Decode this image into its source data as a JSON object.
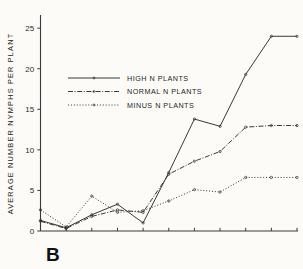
{
  "figure": {
    "panel_label": "B",
    "background_color": "#fdfdfb",
    "ink_color": "#2e2e2e"
  },
  "chart_data": {
    "type": "line",
    "title": "",
    "subtitle": "",
    "panel": "B",
    "xlabel": "",
    "ylabel": "AVERAGE  NUMBER  NYMPHS  PER  PLANT",
    "xlim": [
      0,
      10
    ],
    "ylim": [
      0,
      26.5
    ],
    "yticks": [
      0,
      5,
      10,
      15,
      20,
      25
    ],
    "ytick_labels": [
      "0",
      "5",
      "10",
      "15",
      "20",
      "25"
    ],
    "xticks": [
      0,
      1,
      2,
      3,
      4,
      5,
      6,
      7,
      8,
      9,
      10
    ],
    "xtick_labels": [
      "",
      "",
      "",
      "",
      "",
      "",
      "",
      "",
      "",
      "",
      ""
    ],
    "grid": false,
    "legend_position": "upper-left-inside",
    "x": [
      0,
      1,
      2,
      3,
      4,
      5,
      6,
      7,
      8,
      9,
      10
    ],
    "series": [
      {
        "name": "HIGH  N  PLANTS",
        "linestyle": "solid",
        "color": "#2e2e2e",
        "values": [
          1.3,
          0.4,
          2.0,
          3.3,
          1.0,
          7.2,
          13.8,
          12.9,
          19.3,
          24.0,
          24.0
        ]
      },
      {
        "name": "NORMAL  N  PLANTS",
        "linestyle": "dash-dot",
        "color": "#2e2e2e",
        "values": [
          1.2,
          0.3,
          1.8,
          2.6,
          2.3,
          7.0,
          8.6,
          9.8,
          12.8,
          13.0,
          13.0
        ]
      },
      {
        "name": "MINUS  N  PLANTS",
        "linestyle": "dotted",
        "color": "#2e2e2e",
        "values": [
          2.6,
          0.5,
          4.3,
          2.3,
          2.5,
          3.7,
          5.1,
          4.8,
          6.6,
          6.6,
          6.6
        ]
      }
    ]
  },
  "legend": {
    "entries": [
      {
        "label": "HIGH  N  PLANTS",
        "style": "solid"
      },
      {
        "label": "NORMAL  N  PLANTS",
        "style": "dash-dot"
      },
      {
        "label": "MINUS  N  PLANTS",
        "style": "dotted"
      }
    ]
  }
}
